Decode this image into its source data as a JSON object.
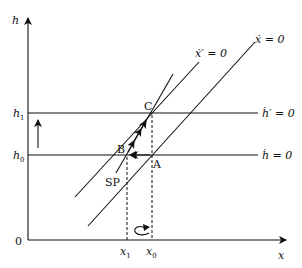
{
  "axes": {
    "y_label": "h",
    "x_label": "x",
    "origin_label": "0"
  },
  "y_ticks": {
    "h1": {
      "base": "h",
      "sub": "1"
    },
    "h0": {
      "base": "h",
      "sub": "0"
    }
  },
  "x_ticks": {
    "x1": {
      "base": "x",
      "sub": "1"
    },
    "x0": {
      "base": "x",
      "sub": "0"
    }
  },
  "curves": {
    "xdot_prime": "ẋ′ = 0",
    "xdot": "ẋ = 0",
    "hdot_prime": "ḣ′ = 0",
    "hdot": "ḣ = 0"
  },
  "points": {
    "A": "A",
    "B": "B",
    "C": "C"
  },
  "path_label": "SP",
  "icons": {
    "up_arrow": "up-arrow",
    "curved_arrow": "clockwise-curved-arrow"
  }
}
